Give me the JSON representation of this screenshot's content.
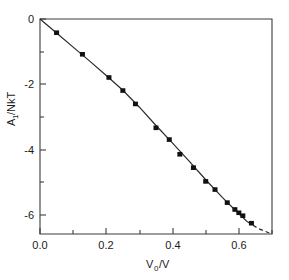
{
  "chart_data": {
    "type": "scatter",
    "title": "",
    "subtitle": "",
    "xlabel": "V_0/V",
    "xlabel_main": "V",
    "xlabel_sub": "0",
    "xlabel_tail": "/V",
    "ylabel": "A_1/NkT",
    "ylabel_main": "A",
    "ylabel_sub": "1",
    "ylabel_tail": "/NkT",
    "xlim": [
      0.0,
      0.7
    ],
    "ylim": [
      -6.58,
      0.0
    ],
    "xticks": [
      0.0,
      0.2,
      0.4,
      0.6
    ],
    "xticklabels": [
      "0.0",
      "0.2",
      "0.4",
      "0.6"
    ],
    "xminorticks": [
      0.1,
      0.3,
      0.5,
      0.7
    ],
    "yticks": [
      0,
      -2,
      -4,
      -6
    ],
    "yticklabels": [
      "0",
      "-2",
      "-4",
      "-6"
    ],
    "yminorticks": [
      -1,
      -3,
      -5
    ],
    "grid": false,
    "legend": null,
    "series": [
      {
        "name": "data points",
        "marker": "filled-square",
        "x": [
          0.05,
          0.128,
          0.208,
          0.25,
          0.288,
          0.35,
          0.39,
          0.422,
          0.463,
          0.5,
          0.528,
          0.565,
          0.588,
          0.6,
          0.612,
          0.638
        ],
        "y": [
          -0.42,
          -1.08,
          -1.79,
          -2.19,
          -2.6,
          -3.33,
          -3.69,
          -4.14,
          -4.55,
          -4.97,
          -5.22,
          -5.62,
          -5.83,
          -5.93,
          -6.02,
          -6.25
        ]
      },
      {
        "name": "fitted curve",
        "style": "solid",
        "x": [
          0.0,
          0.05,
          0.1,
          0.15,
          0.2,
          0.25,
          0.3,
          0.35,
          0.4,
          0.45,
          0.5,
          0.55,
          0.6,
          0.625
        ],
        "y": [
          0.0,
          -0.43,
          -0.86,
          -1.29,
          -1.73,
          -2.18,
          -2.7,
          -3.26,
          -3.8,
          -4.35,
          -4.92,
          -5.46,
          -5.96,
          -6.2
        ]
      },
      {
        "name": "extrapolation",
        "style": "dashed",
        "x": [
          0.625,
          0.66,
          0.7
        ],
        "y": [
          -6.2,
          -6.42,
          -6.58
        ]
      }
    ]
  },
  "axes": {
    "x_tick_label_0": "0.0",
    "x_tick_label_1": "0.2",
    "x_tick_label_2": "0.4",
    "x_tick_label_3": "0.6",
    "y_tick_label_0": "0",
    "y_tick_label_1": "-2",
    "y_tick_label_2": "-4",
    "y_tick_label_3": "-6"
  }
}
